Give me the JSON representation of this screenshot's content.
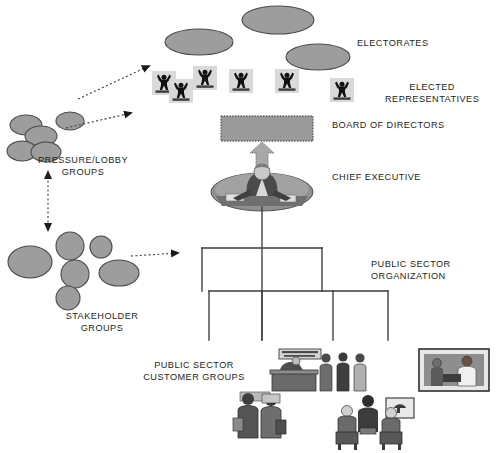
{
  "diagram": {
    "colors": {
      "node_fill": "#9d9d9d",
      "node_stroke": "#4a4a4a",
      "board_fill": "#9a9a9a",
      "board_border": "#6e6e6e",
      "line": "#3b3b3b",
      "text": "#231f20",
      "figure_bg": "#d9d9d9",
      "figure_body": "#111111",
      "background": "#ffffff"
    },
    "labels": {
      "electorates": "ELECTORATES",
      "elected_representatives": "ELECTED\nREPRESENTATIVES",
      "board_of_directors": "BOARD  OF  DIRECTORS",
      "chief_executive": "CHIEF EXECUTIVE",
      "public_sector_organization": "PUBLIC SECTOR\nORGANIZATION",
      "pressure_lobby_groups": "PRESSURE/LOBBY\nGROUPS",
      "stakeholder_groups": "STAKEHOLDER\nGROUPS",
      "public_sector_customer_groups": "PUBLIC SECTOR\nCUSTOMER GROUPS"
    },
    "clipart": {
      "customer_service_sign": "CUSTOMER SERVICE"
    },
    "electorate_ellipses": [
      {
        "cx": 278,
        "cy": 20,
        "rx": 36,
        "ry": 14
      },
      {
        "cx": 199,
        "cy": 42,
        "rx": 34,
        "ry": 13
      },
      {
        "cx": 318,
        "cy": 57,
        "rx": 32,
        "ry": 13
      }
    ],
    "representative_figures": [
      {
        "x": 152,
        "y": 71,
        "w": 24,
        "h": 24
      },
      {
        "x": 169,
        "y": 79,
        "w": 24,
        "h": 24
      },
      {
        "x": 193,
        "y": 66,
        "w": 24,
        "h": 24
      },
      {
        "x": 229,
        "y": 69,
        "w": 24,
        "h": 24
      },
      {
        "x": 275,
        "y": 69,
        "w": 24,
        "h": 24
      },
      {
        "x": 330,
        "y": 78,
        "w": 24,
        "h": 24
      }
    ],
    "pressure_lobby_nodes": [
      {
        "cx": 26,
        "cy": 125,
        "rx": 16,
        "ry": 10
      },
      {
        "cx": 41,
        "cy": 136,
        "rx": 16,
        "ry": 10
      },
      {
        "cx": 70,
        "cy": 121,
        "rx": 14,
        "ry": 9
      },
      {
        "cx": 22,
        "cy": 151,
        "rx": 15,
        "ry": 10
      },
      {
        "cx": 46,
        "cy": 152,
        "rx": 15,
        "ry": 10
      }
    ],
    "stakeholder_nodes": [
      {
        "cx": 30,
        "cy": 262,
        "rx": 22,
        "ry": 16
      },
      {
        "cx": 70,
        "cy": 246,
        "rx": 14,
        "ry": 14
      },
      {
        "cx": 75,
        "cy": 274,
        "rx": 14,
        "ry": 14
      },
      {
        "cx": 68,
        "cy": 298,
        "rx": 12,
        "ry": 12
      },
      {
        "cx": 101,
        "cy": 247,
        "rx": 11,
        "ry": 11
      },
      {
        "cx": 119,
        "cy": 273,
        "rx": 20,
        "ry": 13
      }
    ],
    "connector_arrows": [
      {
        "name": "lobby-to-representatives",
        "from": [
          76,
          100
        ],
        "to": [
          152,
          66
        ],
        "style": "dotted"
      },
      {
        "name": "lobby-to-representatives-lower",
        "from": [
          63,
          128
        ],
        "to": [
          133,
          112
        ],
        "style": "dotted"
      },
      {
        "name": "lobby-stakeholder-two-way",
        "from": [
          48,
          166
        ],
        "to": [
          48,
          232
        ],
        "style": "dotted-double"
      },
      {
        "name": "stakeholder-to-organization",
        "from": [
          126,
          256
        ],
        "to": [
          183,
          253
        ],
        "style": "dotted"
      },
      {
        "name": "board-to-chief-executive",
        "from": [
          262,
          152
        ],
        "to": [
          262,
          132
        ],
        "style": "block-arrow-up"
      }
    ],
    "org_tree": {
      "root_x": 262,
      "root_top_y": 207,
      "level1_y": 248,
      "level1_children_x": [
        202,
        322
      ],
      "level1_children_bottom_y": 291,
      "level2_y": 291,
      "level2_children_x": [
        209,
        262,
        333,
        388
      ],
      "level2_children_bottom_y": 340
    },
    "board_box": {
      "x": 221,
      "y": 116,
      "w": 92,
      "h": 25
    }
  }
}
